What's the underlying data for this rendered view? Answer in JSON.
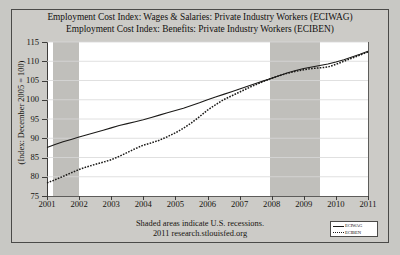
{
  "chart_title_lines": [
    "Employment Cost Index: Wages & Salaries: Private Industry Workers (ECIWAG)",
    "Employment Cost Index: Benefits: Private Industry Workers (ECIBEN)"
  ],
  "footer": {
    "line1": "Shaded areas indicate U.S. recessions.",
    "line2": "2011 research.stlouisfed.org"
  },
  "legend": {
    "position": "bottom-right",
    "entries": [
      {
        "label": "ECIWAG",
        "style": "solid"
      },
      {
        "label": "ECIBEN",
        "style": "dotted"
      }
    ]
  },
  "axis": {
    "y_title": "(Index: December 2005 = 100)",
    "y_ticks": [
      75,
      80,
      85,
      90,
      95,
      100,
      105,
      110,
      115
    ],
    "x_ticks": [
      "2001",
      "2002",
      "2003",
      "2004",
      "2005",
      "2006",
      "2007",
      "2008",
      "2009",
      "2010",
      "2011"
    ]
  },
  "colors": {
    "page_background": "#c8c8c4",
    "panel_background": "#cccbc7",
    "plot_background": "#ffffff",
    "recession_shading": "#c0bfbb",
    "series_line": "#1b1a18",
    "gridline": "#d8d8d8",
    "frame_border": "#4a4a48"
  },
  "chart_data": {
    "type": "line",
    "xlabel": "",
    "ylabel": "(Index: December 2005 = 100)",
    "xlim": [
      2001,
      2011
    ],
    "ylim": [
      75,
      115
    ],
    "grid": true,
    "legend_position": "bottom-right",
    "x": [
      2001.0,
      2001.25,
      2001.5,
      2001.75,
      2002.0,
      2002.25,
      2002.5,
      2002.75,
      2003.0,
      2003.25,
      2003.5,
      2003.75,
      2004.0,
      2004.25,
      2004.5,
      2004.75,
      2005.0,
      2005.25,
      2005.5,
      2005.75,
      2006.0,
      2006.25,
      2006.5,
      2006.75,
      2007.0,
      2007.25,
      2007.5,
      2007.75,
      2008.0,
      2008.25,
      2008.5,
      2008.75,
      2009.0,
      2009.25,
      2009.5,
      2009.75,
      2010.0,
      2010.25,
      2010.5,
      2010.75,
      2011.0
    ],
    "series": [
      {
        "name": "ECIWAG",
        "style": "solid",
        "values": [
          87.6,
          88.4,
          89.1,
          89.7,
          90.3,
          90.9,
          91.5,
          92.1,
          92.7,
          93.3,
          93.8,
          94.3,
          94.8,
          95.4,
          96.0,
          96.6,
          97.2,
          97.8,
          98.5,
          99.2,
          100.0,
          100.7,
          101.4,
          102.1,
          102.8,
          103.5,
          104.2,
          104.9,
          105.6,
          106.3,
          107.0,
          107.6,
          108.1,
          108.5,
          108.9,
          109.3,
          109.8,
          110.4,
          111.1,
          111.8,
          112.6
        ]
      },
      {
        "name": "ECIBEN",
        "style": "dotted",
        "values": [
          78.4,
          79.2,
          80.1,
          81.0,
          81.9,
          82.6,
          83.2,
          83.8,
          84.4,
          85.3,
          86.3,
          87.3,
          88.2,
          88.8,
          89.5,
          90.4,
          91.4,
          92.6,
          94.0,
          95.6,
          97.3,
          98.7,
          100.0,
          101.0,
          102.0,
          103.0,
          103.9,
          104.8,
          105.6,
          106.3,
          106.9,
          107.4,
          107.8,
          108.1,
          108.3,
          108.5,
          109.2,
          110.0,
          110.8,
          111.6,
          112.4
        ]
      }
    ],
    "recessions": [
      {
        "start": 2001.2,
        "end": 2002.0
      },
      {
        "start": 2007.95,
        "end": 2009.5
      }
    ],
    "annotations": [
      "Shaded areas indicate U.S. recessions.",
      "2011 research.stlouisfed.org"
    ]
  }
}
